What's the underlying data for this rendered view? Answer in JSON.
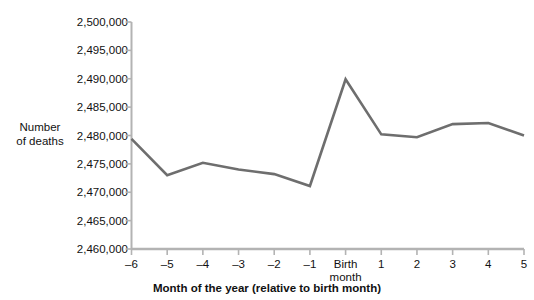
{
  "chart_data": {
    "type": "line",
    "title": "",
    "subtitle": "",
    "xlabel": "Month of the year (relative to birth month)",
    "ylabel": "Number\nof deaths",
    "ylabel_line1": "Number",
    "ylabel_line2": "of deaths",
    "categories": [
      "–6",
      "–5",
      "–4",
      "–3",
      "–2",
      "–1",
      "Birth\nmonth",
      "1",
      "2",
      "3",
      "4",
      "5"
    ],
    "x": [
      -6,
      -5,
      -4,
      -3,
      -2,
      -1,
      0,
      1,
      2,
      3,
      4,
      5
    ],
    "values": [
      2479400,
      2473000,
      2475200,
      2474000,
      2473200,
      2471100,
      2489900,
      2480200,
      2479700,
      2482000,
      2482200,
      2480000
    ],
    "ylim": [
      2460000,
      2500000
    ],
    "ytick_values": [
      2500000,
      2495000,
      2490000,
      2485000,
      2480000,
      2475000,
      2470000,
      2465000,
      2460000
    ],
    "ytick_labels": [
      "2,500,000",
      "2,495,000",
      "2,490,000",
      "2,485,000",
      "2,480,000",
      "2,475,000",
      "2,470,000",
      "2,465,000",
      "2,460,000"
    ],
    "xtick_labels": [
      "–6",
      "–5",
      "–4",
      "–3",
      "–2",
      "–1",
      "Birth\nmonth",
      "1",
      "2",
      "3",
      "4",
      "5"
    ],
    "grid": false,
    "legend": false,
    "legend_position": "none",
    "series": [
      {
        "name": "Number of deaths",
        "color": "#6e6e6e",
        "values": [
          2479400,
          2473000,
          2475200,
          2474000,
          2473200,
          2471100,
          2489900,
          2480200,
          2479700,
          2482000,
          2482200,
          2480000
        ]
      }
    ]
  },
  "colors": {
    "line": "#6e6e6e",
    "axis": "#b3b3b3",
    "tick": "#b3b3b3",
    "text": "#111111",
    "background": "#ffffff"
  },
  "axes": {
    "y_axis_title_line1": "Number",
    "y_axis_title_line2": "of deaths",
    "x_axis_title": "Month of the year (relative to birth month)"
  }
}
